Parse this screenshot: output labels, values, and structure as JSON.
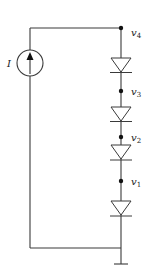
{
  "diagram": {
    "type": "circuit-schematic",
    "source": {
      "kind": "current-source",
      "label": "I",
      "direction": "up"
    },
    "nodes": [
      {
        "id": "v4",
        "label_main": "v",
        "label_sub": "4"
      },
      {
        "id": "v3",
        "label_main": "v",
        "label_sub": "3"
      },
      {
        "id": "v2",
        "label_main": "v",
        "label_sub": "2"
      },
      {
        "id": "v1",
        "label_main": "v",
        "label_sub": "1"
      }
    ],
    "diodes": [
      {
        "id": "D4",
        "between": [
          "v4",
          "v3"
        ],
        "orientation": "anode-top"
      },
      {
        "id": "D3",
        "between": [
          "v3",
          "v2"
        ],
        "orientation": "anode-top"
      },
      {
        "id": "D2",
        "between": [
          "v2",
          "v1"
        ],
        "orientation": "anode-top"
      },
      {
        "id": "D1",
        "between": [
          "v1",
          "ground"
        ],
        "orientation": "anode-top"
      }
    ],
    "ground": {
      "label": ""
    }
  }
}
